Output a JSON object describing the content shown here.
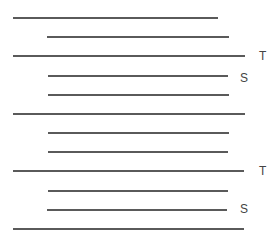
{
  "diagram": {
    "line_color": "#5a5a5a",
    "label_color": "#444444",
    "lines": [
      {
        "y": 17,
        "x1": 13,
        "x2": 218,
        "label": ""
      },
      {
        "y": 36,
        "x1": 47,
        "x2": 229,
        "label": ""
      },
      {
        "y": 55,
        "x1": 13,
        "x2": 245,
        "label": "T"
      },
      {
        "y": 75,
        "x1": 48,
        "x2": 228,
        "label": "S"
      },
      {
        "y": 94,
        "x1": 48,
        "x2": 229,
        "label": ""
      },
      {
        "y": 113,
        "x1": 13,
        "x2": 245,
        "label": ""
      },
      {
        "y": 132,
        "x1": 48,
        "x2": 229,
        "label": ""
      },
      {
        "y": 151,
        "x1": 48,
        "x2": 228,
        "label": ""
      },
      {
        "y": 170,
        "x1": 13,
        "x2": 244,
        "label": "T"
      },
      {
        "y": 190,
        "x1": 48,
        "x2": 228,
        "label": ""
      },
      {
        "y": 209,
        "x1": 47,
        "x2": 227,
        "label": "S"
      },
      {
        "y": 228,
        "x1": 13,
        "x2": 244,
        "label": ""
      }
    ],
    "labels": [
      {
        "text": "T",
        "x": 259,
        "y": 50
      },
      {
        "text": "S",
        "x": 240,
        "y": 72
      },
      {
        "text": "T",
        "x": 259,
        "y": 165
      },
      {
        "text": "S",
        "x": 240,
        "y": 203
      }
    ]
  }
}
